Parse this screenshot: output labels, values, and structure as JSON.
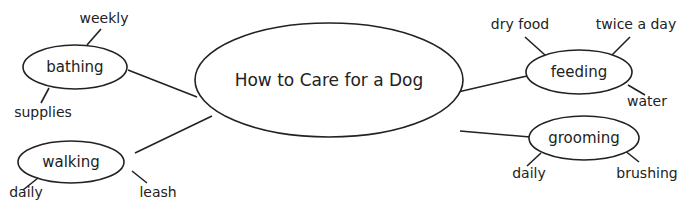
{
  "diagram": {
    "type": "concept-map",
    "center": {
      "label": "How to Care for a Dog"
    },
    "branches": [
      {
        "id": "bathing",
        "label": "bathing",
        "details": [
          "weekly",
          "supplies"
        ]
      },
      {
        "id": "walking",
        "label": "walking",
        "details": [
          "daily",
          "leash"
        ]
      },
      {
        "id": "feeding",
        "label": "feeding",
        "details": [
          "dry food",
          "twice a day",
          "water"
        ]
      },
      {
        "id": "grooming",
        "label": "grooming",
        "details": [
          "daily",
          "brushing"
        ]
      }
    ]
  },
  "colors": {
    "stroke": "#222222",
    "background": "#ffffff",
    "text": "#222222"
  }
}
